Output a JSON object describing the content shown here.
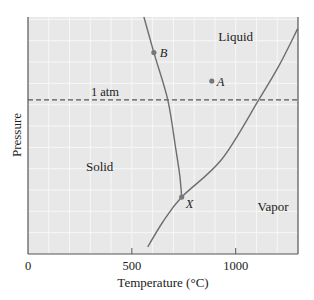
{
  "chart_data": {
    "type": "line",
    "title": "",
    "xlabel": "Temperature (°C)",
    "ylabel": "Pressure",
    "xlim": [
      0,
      1300
    ],
    "ylim": [
      0,
      100
    ],
    "x_ticks": [
      0,
      500,
      1000
    ],
    "x_tick_labels": [
      "0",
      "500",
      "1000"
    ],
    "y_ticks": [],
    "grid": true,
    "series": [
      {
        "name": "solid-liquid boundary",
        "points": [
          [
            558,
            100
          ],
          [
            606,
            85
          ],
          [
            673,
            65
          ],
          [
            712,
            44
          ],
          [
            731,
            33
          ],
          [
            740,
            24
          ]
        ]
      },
      {
        "name": "vapor boundary",
        "points": [
          [
            577,
            3
          ],
          [
            649,
            13.5
          ],
          [
            740,
            24
          ],
          [
            933,
            40
          ],
          [
            1111,
            65
          ],
          [
            1212,
            80
          ],
          [
            1298,
            95
          ]
        ]
      }
    ],
    "reference_lines": [
      {
        "name": "1 atm",
        "label": "1 atm",
        "y": 65,
        "style": "dashed"
      }
    ],
    "points": [
      {
        "label": "A",
        "x": 885,
        "y": 73
      },
      {
        "label": "B",
        "x": 606,
        "y": 85
      },
      {
        "label": "X",
        "x": 740,
        "y": 24
      }
    ],
    "region_labels": [
      {
        "label": "Liquid",
        "x": 1000,
        "y": 90
      },
      {
        "label": "Solid",
        "x": 345,
        "y": 35
      },
      {
        "label": "Vapor",
        "x": 1180,
        "y": 18
      }
    ],
    "colors": {
      "plot_background": "#e8e8e8",
      "curve": "#6e6e6e",
      "axis": "#555555",
      "point": "#777777"
    }
  }
}
